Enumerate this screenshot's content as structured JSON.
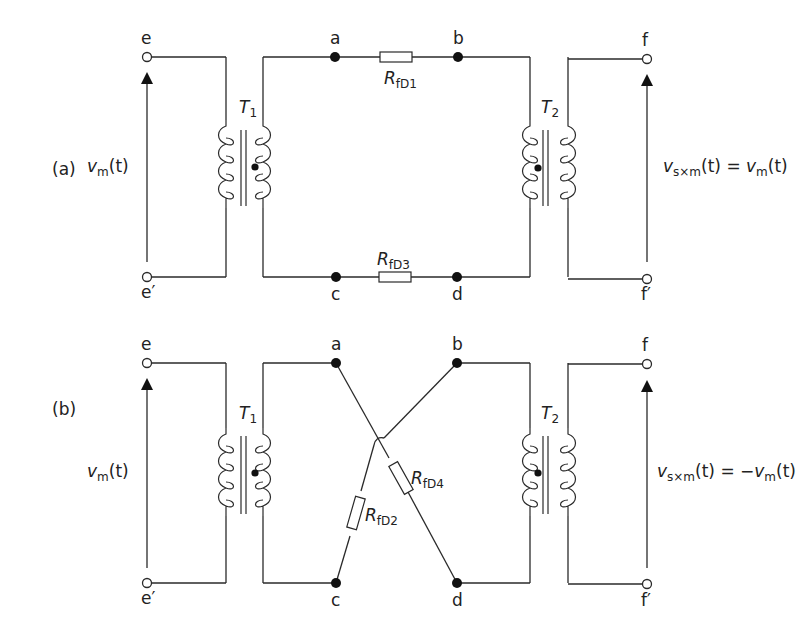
{
  "figure": {
    "panels": [
      {
        "id": "a",
        "label": "(a)",
        "input": {
          "top_terminal": "e",
          "bottom_terminal": "e′",
          "voltage_symbol": "v",
          "voltage_sub": "m",
          "voltage_arg": "(t)"
        },
        "transformer_1": {
          "symbol": "T",
          "sub": "1"
        },
        "transformer_2": {
          "symbol": "T",
          "sub": "2"
        },
        "nodes": {
          "top_left": "a",
          "top_right": "b",
          "bottom_left": "c",
          "bottom_right": "d"
        },
        "resistors": [
          {
            "symbol": "R",
            "sub": "fD1",
            "connects": "a-b"
          },
          {
            "symbol": "R",
            "sub": "fD3",
            "connects": "c-d"
          }
        ],
        "output": {
          "top_terminal": "f",
          "bottom_terminal": "f′",
          "lhs_symbol": "v",
          "lhs_sub": "s×m",
          "lhs_arg": "(t) = ",
          "rhs_symbol": "v",
          "rhs_sub": "m",
          "rhs_arg": "(t)"
        }
      },
      {
        "id": "b",
        "label": "(b)",
        "input": {
          "top_terminal": "e",
          "bottom_terminal": "e′",
          "voltage_symbol": "v",
          "voltage_sub": "m",
          "voltage_arg": "(t)"
        },
        "transformer_1": {
          "symbol": "T",
          "sub": "1"
        },
        "transformer_2": {
          "symbol": "T",
          "sub": "2"
        },
        "nodes": {
          "top_left": "a",
          "top_right": "b",
          "bottom_left": "c",
          "bottom_right": "d"
        },
        "resistors": [
          {
            "symbol": "R",
            "sub": "fD2",
            "connects": "c-b"
          },
          {
            "symbol": "R",
            "sub": "fD4",
            "connects": "a-d"
          }
        ],
        "output": {
          "top_terminal": "f",
          "bottom_terminal": "f′",
          "lhs_symbol": "v",
          "lhs_sub": "s×m",
          "lhs_arg": "(t) = −",
          "rhs_symbol": "v",
          "rhs_sub": "m",
          "rhs_arg": "(t)"
        }
      }
    ]
  }
}
